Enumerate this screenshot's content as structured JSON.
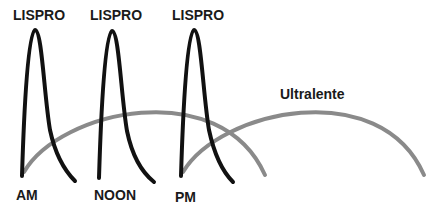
{
  "diagram": {
    "type": "insulin-action-profile",
    "colors": {
      "lispro": "#111111",
      "ultralente": "#8a8a8a",
      "text": "#1a1a1a",
      "background": "#ffffff"
    },
    "lispro_doses": [
      {
        "label": "LISPRO",
        "time_label": "AM"
      },
      {
        "label": "LISPRO",
        "time_label": "NOON"
      },
      {
        "label": "LISPRO",
        "time_label": "PM"
      }
    ],
    "ultralente": {
      "label": "Ultralente",
      "doses": 2
    }
  }
}
